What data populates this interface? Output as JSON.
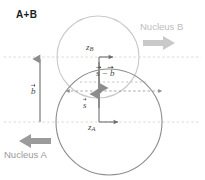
{
  "figure": {
    "title": "A+B",
    "type": "nucleus-collision-geometry-diagram",
    "background_color": "#ffffff"
  },
  "labels": {
    "nucleus_b": "Nucleus B",
    "nucleus_a": "Nucleus A",
    "axis_zb_symbol": "z",
    "axis_zb_subscript": "B",
    "axis_za_symbol": "z",
    "axis_za_subscript": "A",
    "vector_b": "b",
    "vector_s": "s",
    "vector_s_minus_b": "s − b"
  },
  "colors": {
    "title_text": "#1c1c1c",
    "nucleus_b_text": "#bdbdbd",
    "nucleus_a_text": "#9a9a9a",
    "math_text": "#4a4a4a",
    "circle_b_stroke": "#c7c7c7",
    "circle_a_stroke": "#8d8d8d",
    "dashed_guide": "#e0cfc8",
    "dashed_vector": "#8d8d8d",
    "block_arrow_b": "#c9c9c9",
    "block_arrow_a": "#9b9b9b",
    "axis_line": "#6f6f6f",
    "vector_line": "#8d8d8d"
  },
  "geometry": {
    "circle_b": {
      "cx": 98,
      "cy": 57,
      "r": 41,
      "nucleus": "B"
    },
    "circle_a": {
      "cx": 109,
      "cy": 122,
      "r": 53,
      "nucleus": "A"
    },
    "guide_line_top_y": 57,
    "guide_line_mid_y": 91,
    "guide_line_bottom_y": 122,
    "impact_point_x": 99,
    "impact_point_y": 91,
    "b_arrow": {
      "x": 40,
      "y_from": 122,
      "y_to": 57
    },
    "s_arrow": {
      "x": 99,
      "y_from": 122,
      "y_to": 91
    },
    "s_minus_b_arrow": {
      "x": 99,
      "y_from": 57,
      "y_to": 91
    }
  },
  "arrows": {
    "nucleus_b_direction": "right",
    "nucleus_a_direction": "left"
  }
}
